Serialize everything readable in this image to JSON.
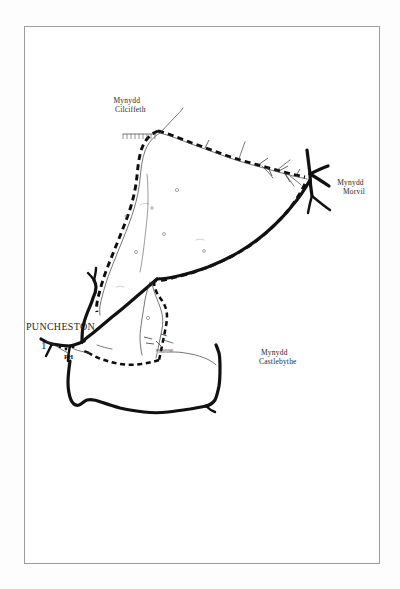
{
  "page": {
    "type": "scanned-map-figure",
    "background_color": "#ffffff",
    "frame_color": "#9c9c9c",
    "ink_color": "#111111"
  },
  "map": {
    "title_labels": [
      {
        "name": "mynydd-cilciffeth",
        "line1": "Mynydd",
        "line2": "Cilciffeth",
        "x": 115,
        "y": 98
      },
      {
        "name": "mynydd-morvil",
        "line1": "Mynydd",
        "line2": "Morvil",
        "x": 338,
        "y": 180
      },
      {
        "name": "mynydd-castlebythe",
        "line1": "Mynydd",
        "line2": "Castlebythe",
        "x": 253,
        "y": 350
      }
    ],
    "settlement": {
      "name": "puncheston",
      "label": "PUNCHESTON",
      "x": 27,
      "y": 322
    },
    "annotations": [
      {
        "name": "parsonage",
        "label": "parsonage",
        "x": 157,
        "y": 348
      },
      {
        "name": "public-house",
        "label": "PH",
        "x": 66,
        "y": 355
      },
      {
        "name": "figure-number",
        "label": "1",
        "x": 43,
        "y": 342
      }
    ],
    "legend_features": {
      "parish_boundary": "dashed heavy line",
      "main_road": "solid heavy line",
      "minor_road": "thin single line",
      "escarpment_hachure": "ticked line",
      "field_marks": "small open circles"
    }
  }
}
